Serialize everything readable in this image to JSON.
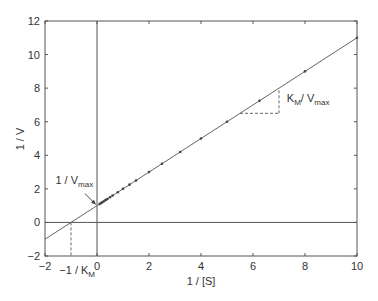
{
  "chart_data": {
    "type": "line",
    "title": "",
    "xlabel": "1 / [S]",
    "ylabel": "1 / V",
    "xlim": [
      -2,
      10
    ],
    "ylim": [
      -2,
      12
    ],
    "xticks": [
      -2,
      0,
      2,
      4,
      6,
      8,
      10
    ],
    "yticks": [
      -2,
      0,
      2,
      4,
      6,
      8,
      10,
      12
    ],
    "xtick_labels": [
      "−2",
      "0",
      "2",
      "4",
      "6",
      "8",
      "10"
    ],
    "ytick_labels": [
      "−2",
      "0",
      "2",
      "4",
      "6",
      "8",
      "10",
      "12"
    ],
    "grid": false,
    "legend": null,
    "series": [
      {
        "name": "Lineweaver-Burk fit",
        "kind": "line",
        "slope": 1,
        "intercept": 1,
        "x": [
          -2,
          10
        ],
        "y": [
          -1,
          11
        ]
      },
      {
        "name": "data points",
        "kind": "scatter",
        "x": [
          0.1,
          0.15,
          0.2,
          0.25,
          0.3,
          0.35,
          0.4,
          0.5,
          0.6,
          0.8,
          1.0,
          1.25,
          1.5,
          2.0,
          2.5,
          3.2,
          4.0,
          5.0,
          6.25,
          8.0,
          10.0
        ],
        "y": [
          1.1,
          1.15,
          1.2,
          1.25,
          1.3,
          1.35,
          1.4,
          1.5,
          1.6,
          1.8,
          2.0,
          2.25,
          2.5,
          3.0,
          3.5,
          4.2,
          5.0,
          6.0,
          7.25,
          9.0,
          11.0
        ]
      }
    ],
    "reference_lines": {
      "y_zero": 0,
      "x_zero": 0
    },
    "annotations": [
      {
        "text_main": "1 / V",
        "text_sub": "max",
        "label_x": -1.6,
        "label_y": 2.3,
        "arrow_to": [
          0,
          1
        ]
      },
      {
        "text_main": "−1 / K",
        "text_sub": "M",
        "label_x": -1.45,
        "label_y": -3.1,
        "dashed_x": -1
      },
      {
        "text_main": "K",
        "text_sub": "M",
        "text_rest": "/ V",
        "text_sub2": "max",
        "label_x": 7.3,
        "label_y": 7.2,
        "slope_triangle": {
          "x0": 5.5,
          "x1": 7.0,
          "y0": 6.5,
          "y1": 8.0
        }
      }
    ]
  }
}
